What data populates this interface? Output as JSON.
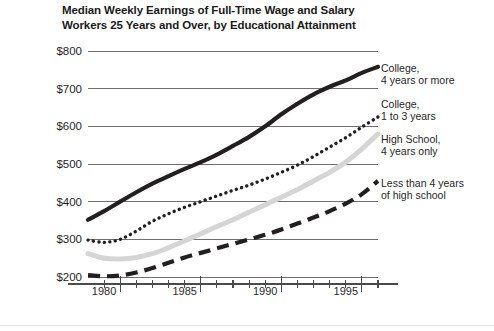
{
  "chart_data": {
    "type": "line",
    "title": "Median Weekly Earnings of Full-Time Wage and Salary Workers 25 Years and Over, by Educational Attainment",
    "title_lines": [
      "Median Weekly Earnings of Full-Time Wage and Salary",
      "Workers 25 Years and Over, by Educational Attainment"
    ],
    "xlabel": "",
    "ylabel": "",
    "xlim": [
      1978,
      1996
    ],
    "ylim": [
      200,
      800
    ],
    "grid": true,
    "legend_position": "right-of-line-ends",
    "y_ticks": [
      200,
      300,
      400,
      500,
      600,
      700,
      800
    ],
    "y_tick_labels": [
      "$200",
      "$300",
      "$400",
      "$500",
      "$600",
      "$700",
      "$800"
    ],
    "x_ticks_major": [
      1980,
      1985,
      1990,
      1995
    ],
    "x_tick_labels": [
      "1980",
      "1985",
      "1990",
      "1995"
    ],
    "x_ticks_minor": [
      1979,
      1981,
      1982,
      1983,
      1984,
      1986,
      1987,
      1988,
      1989,
      1991,
      1992,
      1993,
      1994,
      1996
    ],
    "x": [
      1978,
      1979,
      1980,
      1981,
      1982,
      1983,
      1984,
      1985,
      1986,
      1987,
      1988,
      1989,
      1990,
      1991,
      1992,
      1993,
      1994,
      1995,
      1996
    ],
    "series": [
      {
        "name": "College, 4 years or more",
        "label_lines": [
          "College,",
          "4 years or more"
        ],
        "style": "solid",
        "color": "#231f20",
        "width": 4.2,
        "values": [
          352,
          375,
          400,
          425,
          448,
          468,
          487,
          505,
          525,
          548,
          572,
          600,
          632,
          660,
          685,
          705,
          722,
          742,
          758
        ]
      },
      {
        "name": "College, 1 to 3 years",
        "label_lines": [
          "College,",
          "1 to 3 years"
        ],
        "style": "dotted",
        "color": "#231f20",
        "width": 3.4,
        "values": [
          298,
          292,
          300,
          322,
          348,
          368,
          385,
          400,
          415,
          430,
          444,
          460,
          478,
          497,
          520,
          545,
          570,
          598,
          625
        ]
      },
      {
        "name": "High School, 4 years only",
        "label_lines": [
          "High School,",
          "4 years only"
        ],
        "style": "solid",
        "color": "#d5d5d5",
        "width": 5.0,
        "values": [
          262,
          250,
          248,
          252,
          262,
          278,
          296,
          315,
          334,
          352,
          372,
          392,
          412,
          432,
          455,
          478,
          505,
          540,
          580
        ]
      },
      {
        "name": "Less than 4 years of high school",
        "label_lines": [
          "Less than 4 years",
          "of high school"
        ],
        "style": "dashed",
        "color": "#231f20",
        "width": 4.2,
        "values": [
          205,
          202,
          204,
          212,
          224,
          238,
          252,
          264,
          276,
          288,
          300,
          312,
          326,
          342,
          358,
          375,
          395,
          420,
          455
        ]
      }
    ]
  },
  "axis": {
    "y_labels": [
      "$800",
      "$700",
      "$600",
      "$500",
      "$400",
      "$300",
      "$200"
    ],
    "x_labels": [
      "1980",
      "1985",
      "1990",
      "1995"
    ]
  },
  "labels": {
    "college4": {
      "l1": "College,",
      "l2": "4 years or more"
    },
    "college13": {
      "l1": "College,",
      "l2": "1 to 3 years"
    },
    "highschool": {
      "l1": "High School,",
      "l2": "4 years only"
    },
    "lessthan": {
      "l1": "Less than 4 years",
      "l2": "of high school"
    }
  },
  "colors": {
    "ink": "#231f20",
    "grid": "#6e6e6e",
    "gray_series": "#d5d5d5"
  }
}
